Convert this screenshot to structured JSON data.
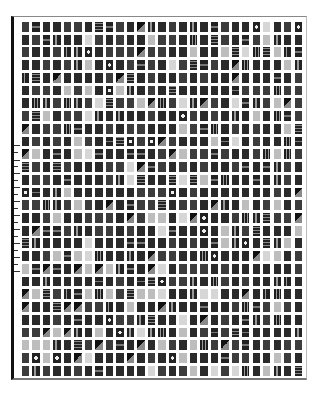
{
  "figure": {
    "grid": {
      "columns": 27,
      "rows": 28
    },
    "colors": {
      "background": "#ffffff",
      "frame_left": "#111111",
      "tile_dark": "#2a2a2a",
      "tile_light": "#bdbdbd"
    },
    "left_ticks_y": [
      145,
      152,
      160,
      166,
      173,
      180,
      187,
      194,
      201,
      208,
      215,
      222,
      229,
      236,
      243,
      250,
      257,
      264,
      271
    ]
  }
}
